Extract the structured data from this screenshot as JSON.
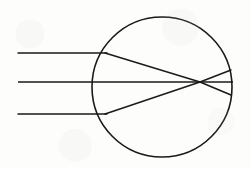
{
  "diagram": {
    "background_color": "#fdfdfc",
    "stroke_color": "#1a1a1a",
    "canvas": {
      "width": 251,
      "height": 169
    },
    "lens": {
      "shape": "circle",
      "center_x": 162,
      "center_y": 87,
      "radius": 70,
      "stroke_width": 1.6,
      "label": "spherical-lens-body"
    },
    "focal_point": {
      "x": 200,
      "y": 82,
      "label": "focal-point"
    },
    "incoming_rays": [
      {
        "name": "upper-incoming-ray",
        "x1": 18,
        "y1": 53,
        "x2": 107,
        "y2": 53,
        "description": "parallel ray above optical axis"
      },
      {
        "name": "axis-incoming-ray",
        "x1": 18,
        "y1": 82,
        "x2": 92,
        "y2": 82,
        "description": "ray along the optical axis"
      },
      {
        "name": "lower-incoming-ray",
        "x1": 18,
        "y1": 114,
        "x2": 107,
        "y2": 114,
        "description": "parallel ray below optical axis"
      }
    ],
    "refracted_rays": [
      {
        "name": "upper-refracted-ray",
        "x1": 105,
        "y1": 53,
        "x2": 200,
        "y2": 82,
        "description": "upper ray bending down toward focus"
      },
      {
        "name": "axis-refracted-ray",
        "x1": 92,
        "y1": 82,
        "x2": 200,
        "y2": 82,
        "description": "undeviated axial ray through the centre"
      },
      {
        "name": "lower-refracted-ray",
        "x1": 105,
        "y1": 114,
        "x2": 200,
        "y2": 82,
        "description": "lower ray bending up toward focus"
      }
    ],
    "exit_rays": [
      {
        "name": "upper-exit-ray",
        "x1": 200,
        "y1": 82,
        "x2": 231,
        "y2": 70,
        "description": "diverging ray after the focal crossing, upward"
      },
      {
        "name": "axis-exit-ray",
        "x1": 200,
        "y1": 82,
        "x2": 233,
        "y2": 82,
        "description": "axial ray continuing to the right surface"
      },
      {
        "name": "lower-exit-ray",
        "x1": 200,
        "y1": 82,
        "x2": 231,
        "y2": 95,
        "description": "diverging ray after the focal crossing, downward"
      }
    ]
  }
}
